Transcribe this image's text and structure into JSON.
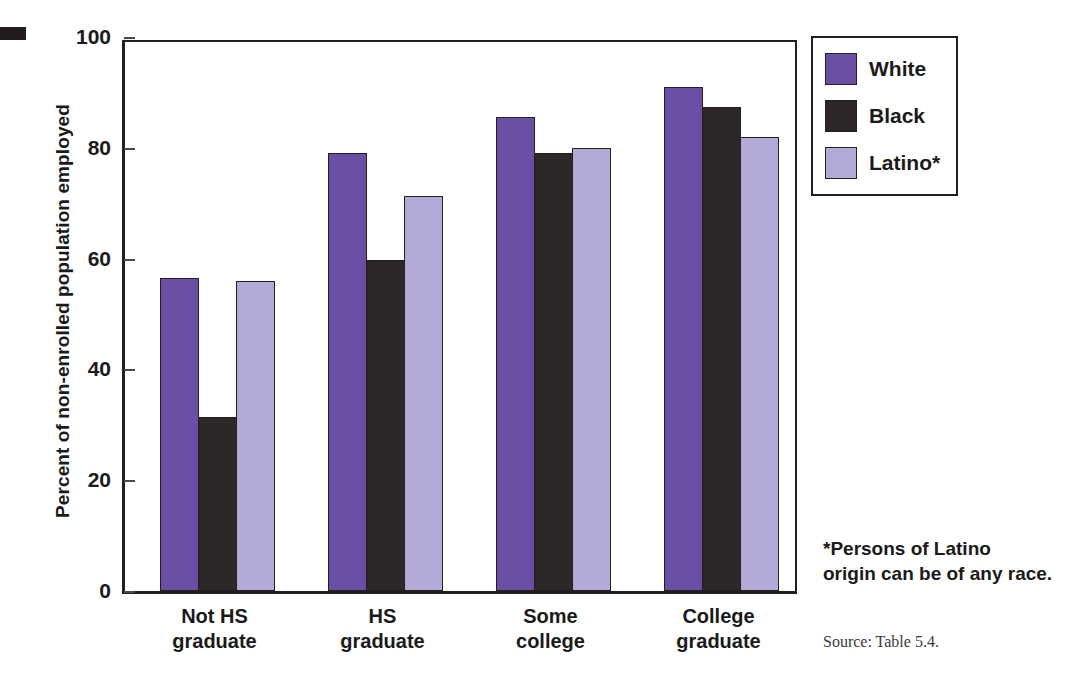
{
  "chart_data": {
    "type": "bar",
    "title": "",
    "xlabel": "",
    "ylabel": "Percent of non-enrolled population employed",
    "ylim": [
      0,
      100
    ],
    "yticks": [
      0,
      20,
      40,
      60,
      80,
      100
    ],
    "grid": false,
    "legend_position": "top-right",
    "categories": [
      "Not HS\ngraduate",
      "HS\ngraduate",
      "Some\ncollege",
      "College\ngraduate"
    ],
    "category_labels": [
      {
        "line1": "Not HS",
        "line2": "graduate"
      },
      {
        "line1": "HS",
        "line2": "graduate"
      },
      {
        "line1": "Some",
        "line2": "college"
      },
      {
        "line1": "College",
        "line2": "graduate"
      }
    ],
    "series": [
      {
        "name": "White",
        "color": "#6B4FA5",
        "values": [
          56.5,
          79.0,
          85.5,
          91.0
        ]
      },
      {
        "name": "Black",
        "color": "#2D2727",
        "values": [
          31.5,
          59.7,
          79.0,
          87.3
        ]
      },
      {
        "name": "Latino*",
        "color": "#B3AAD8",
        "values": [
          56.0,
          71.3,
          80.0,
          82.0
        ]
      }
    ],
    "footnote": "*Persons of Latino origin can be of any race.",
    "source": "Source: Table 5.4."
  },
  "axis": {
    "y_title": "Percent of non-enrolled population employed",
    "tick_labels": [
      "0",
      "20",
      "40",
      "60",
      "80",
      "100"
    ]
  },
  "legend": {
    "items": [
      {
        "label": "White",
        "color": "#6B4FA5"
      },
      {
        "label": "Black",
        "color": "#2D2727"
      },
      {
        "label": "Latino*",
        "color": "#B3AAD8"
      }
    ]
  },
  "notes": {
    "footnote_line1": "*Persons of Latino",
    "footnote_line2": "origin can be of any race.",
    "source": "Source: Table 5.4."
  },
  "colors": {
    "white_series": "#6B4FA5",
    "black_series": "#2D2727",
    "latino_series": "#B3AAD8",
    "axis": "#231f20"
  }
}
